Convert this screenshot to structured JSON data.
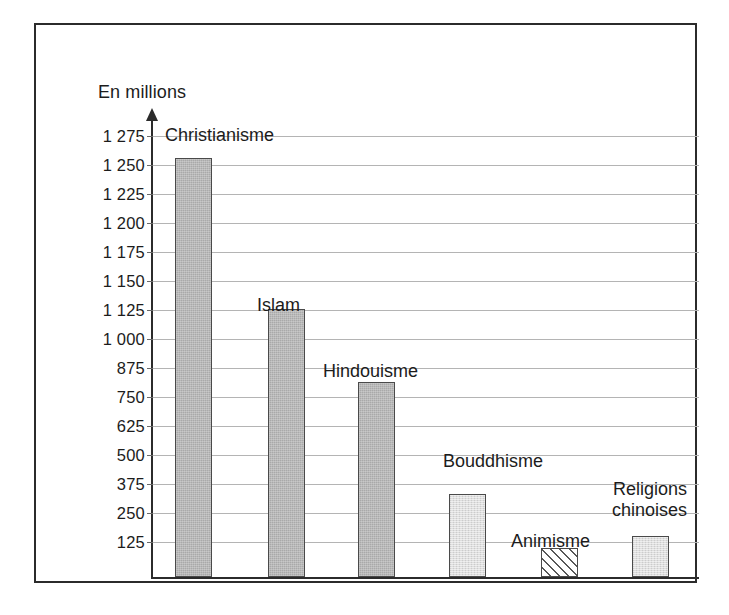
{
  "figure": {
    "axis_caption": "En millions"
  },
  "chart_data": {
    "type": "bar",
    "title": "",
    "subtitle": "",
    "xlabel": "",
    "ylabel": "En millions",
    "grid": true,
    "legend": "none",
    "annotations": [
      "En millions"
    ],
    "categories": [
      "Christianisme",
      "Islam",
      "Hindouisme",
      "Bouddhisme",
      "Animisme",
      "Religions chinoises"
    ],
    "values": [
      1255,
      1125,
      810,
      330,
      100,
      150
    ],
    "ylim": [
      0,
      1300
    ],
    "ytick_labels": [
      "1 275",
      "1 250",
      "1 225",
      "1 200",
      "1 175",
      "1 150",
      "1 125",
      "1 000",
      "875",
      "750",
      "625",
      "500",
      "375",
      "250",
      "125"
    ],
    "ytick_values": [
      1275,
      1250,
      1225,
      1200,
      1175,
      1150,
      1125,
      1000,
      875,
      750,
      625,
      500,
      375,
      250,
      125
    ],
    "bar_fills": [
      "dark",
      "dark",
      "dark",
      "light",
      "hatch",
      "light"
    ],
    "colors": {
      "bar_dark": "#a9a9a9",
      "bar_light": "#dedede",
      "bar_hatch": "#ffffff",
      "bar_outline": "#4a4a4a",
      "gridline": "#b4b4b4",
      "axis": "#2b2b2b",
      "text": "#1c1c1c",
      "frame": "#2b2b2b"
    }
  },
  "bar_labels": [
    {
      "lines": [
        "Christianisme"
      ],
      "align": "left"
    },
    {
      "lines": [
        "Islam"
      ],
      "align": "left"
    },
    {
      "lines": [
        "Hindouisme"
      ],
      "align": "left"
    },
    {
      "lines": [
        "Bouddhisme"
      ],
      "align": "left"
    },
    {
      "lines": [
        "Animisme"
      ],
      "align": "left"
    },
    {
      "lines": [
        "Religions",
        "chinoises"
      ],
      "align": "right"
    }
  ]
}
